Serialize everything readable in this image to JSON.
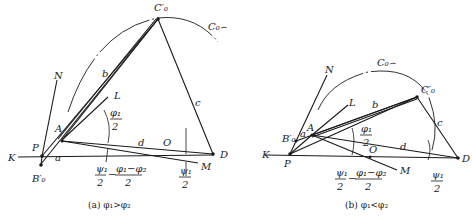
{
  "figure_a": {
    "caption": "(a)  φ₁>φ₂",
    "points": {
      "C0p": "C′₀",
      "C0arc": "C₀⌢",
      "N": "N",
      "L": "L",
      "A": "A",
      "P": "P",
      "B0p": "B′₀",
      "K": "K",
      "D": "D",
      "O": "O",
      "M": "M"
    },
    "links": {
      "a": "a",
      "b": "b",
      "c": "c",
      "d": "d"
    },
    "angles": {
      "phi1_half_num": "φ₁",
      "phi1_half_den": "2",
      "psi1_half_num": "ψ₁",
      "psi1_half_den": "2",
      "minus": "−",
      "diff_num": "φ₁−φ₂",
      "diff_den": "2",
      "psi1_half_right_num": "ψ₁",
      "psi1_half_right_den": "2"
    }
  },
  "figure_b": {
    "caption": "(b)  φ₁<φ₂",
    "points": {
      "C0p": "C′₀",
      "C0arc": "C₀⌢",
      "N": "N",
      "L": "L",
      "A": "A",
      "P": "P",
      "B0p": "B′₀",
      "K": "K",
      "D": "D",
      "O": "O",
      "M": "M"
    },
    "links": {
      "a": "a",
      "b": "b",
      "c": "c",
      "d": "d"
    },
    "angles": {
      "phi1_half_num": "φ₁",
      "phi1_half_den": "2",
      "psi1_half_num": "ψ₁",
      "psi1_half_den": "2",
      "minus": "−",
      "diff_num": "φ₁−φ₂",
      "diff_den": "2",
      "psi1_half_right_num": "ψ₁",
      "psi1_half_right_den": "2"
    }
  }
}
